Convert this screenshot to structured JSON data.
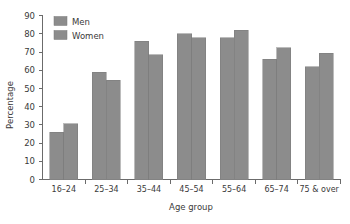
{
  "chart_data": {
    "type": "bar",
    "title": "",
    "xlabel": "Age group",
    "ylabel": "Percentage",
    "categories": [
      "16–24",
      "25–34",
      "35–44",
      "45–54",
      "55–64",
      "65–74",
      "75 & over"
    ],
    "series": [
      {
        "name": "Men",
        "color": "#8c8c8c",
        "values": [
          26,
          59,
          76,
          80,
          78,
          66,
          62
        ]
      },
      {
        "name": "Women",
        "color": "#8c8c8c",
        "values": [
          30.5,
          54.5,
          68.5,
          78,
          82,
          72.5,
          69.5
        ]
      }
    ],
    "ylim": [
      0,
      90
    ],
    "yticks": [
      0,
      10,
      20,
      30,
      40,
      50,
      60,
      70,
      80,
      90
    ],
    "ytick_labels": [
      "0",
      "10",
      "20",
      "30",
      "40",
      "50",
      "60",
      "70",
      "80",
      "90"
    ],
    "grid": false,
    "legend_position": "top-left",
    "bar_color": "#8c8c8c",
    "bar_edge_color": "#7a7a7a",
    "axis_color": "#6b6b6b",
    "background": "#ffffff"
  },
  "legend": {
    "entries": [
      {
        "label": "Men",
        "swatch_name": "legend-swatch-men"
      },
      {
        "label": "Women",
        "swatch_name": "legend-swatch-women"
      }
    ]
  },
  "axes": {
    "y_title": "Percentage",
    "x_title": "Age group"
  }
}
